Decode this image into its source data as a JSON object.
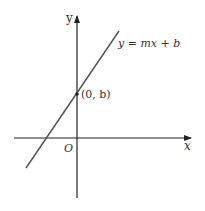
{
  "diagram": {
    "type": "coordinate-plane-line",
    "axes": {
      "x_label": "x",
      "y_label": "y",
      "origin_label": "O"
    },
    "line": {
      "equation": "y = mx + b",
      "color": "#555555"
    },
    "point": {
      "label": "(0, b)"
    },
    "colors": {
      "axis": "#222222",
      "text": "#333333",
      "background": "#ffffff"
    }
  }
}
